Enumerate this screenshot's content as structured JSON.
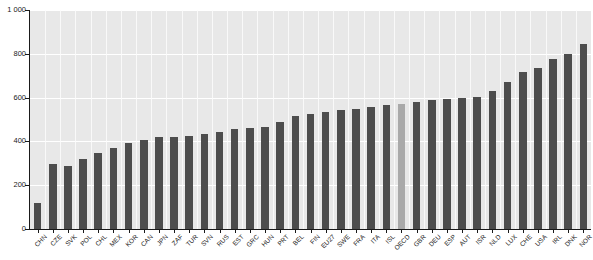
{
  "chart_data": {
    "type": "bar",
    "title": "",
    "xlabel": "",
    "ylabel": "",
    "ylim": [
      0,
      1000
    ],
    "yticks": [
      0,
      200,
      400,
      600,
      800,
      1000
    ],
    "ytick_labels": [
      "0",
      "200",
      "400",
      "600",
      "800",
      "1 000"
    ],
    "grid": true,
    "legend": "none",
    "highlight_category": "OECD",
    "colors": {
      "bar": "#4d4d4d",
      "highlight_bar": "#a9a9a9",
      "plot_background": "#e8e8e8",
      "gridline": "#ffffff",
      "axis": "#1a1a1a",
      "page_background": "#ffffff",
      "text": "#1a1a1a"
    },
    "categories": [
      "CHN",
      "CZE",
      "SVK",
      "POL",
      "CHL",
      "MEX",
      "KOR",
      "CAN",
      "JPN",
      "ZAF",
      "TUR",
      "SVN",
      "RUS",
      "EST",
      "GRC",
      "HUN",
      "PRT",
      "BEL",
      "FIN",
      "EU27",
      "SWE",
      "FRA",
      "ITA",
      "ISL",
      "OECD",
      "GBR",
      "DEU",
      "ESP",
      "AUT",
      "ISR",
      "NLD",
      "LUX",
      "CHE",
      "USA",
      "IRL",
      "DNK",
      "NOR"
    ],
    "values": [
      120,
      295,
      290,
      320,
      345,
      370,
      395,
      405,
      420,
      420,
      425,
      435,
      445,
      455,
      460,
      465,
      490,
      515,
      525,
      535,
      545,
      550,
      555,
      565,
      570,
      580,
      590,
      595,
      600,
      605,
      630,
      670,
      715,
      735,
      775,
      800,
      845
    ]
  }
}
